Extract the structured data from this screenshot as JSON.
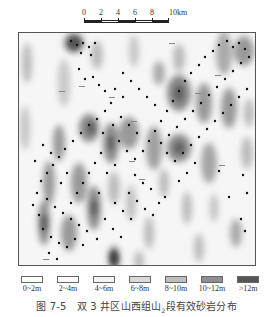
{
  "scale_bar": {
    "ticks": [
      "0",
      "2",
      "4",
      "6",
      "8",
      "10km"
    ],
    "unit": "km"
  },
  "map": {
    "title": "双3井区山西组山2段有效砂岩分布",
    "frame_color": "#555555",
    "background": "#f7f7f7"
  },
  "legend": {
    "items": [
      {
        "label": "0~2m",
        "color": "#ffffff"
      },
      {
        "label": "2~4m",
        "color": "#fbfbfb"
      },
      {
        "label": "4~6m",
        "color": "#f3f3f3"
      },
      {
        "label": "6~8m",
        "color": "#d9d9d9"
      },
      {
        "label": "8~10m",
        "color": "#bdbdbd"
      },
      {
        "label": "10~12m",
        "color": "#8f8f8f"
      },
      {
        "label": ">12m",
        "color": "#555555"
      }
    ]
  },
  "caption": {
    "figure_number": "图 7-5",
    "text_before_sub": "双 3 井区山西组山",
    "subscript": "2",
    "text_after_sub": "段有效砂岩分布"
  }
}
